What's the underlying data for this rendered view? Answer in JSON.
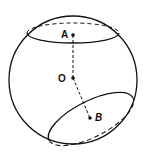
{
  "diagram": {
    "points": [
      {
        "id": "A",
        "label": "A"
      },
      {
        "id": "O",
        "label": "O"
      },
      {
        "id": "B",
        "label": "B"
      }
    ],
    "colors": {
      "stroke": "#111111",
      "background": "#ffffff"
    }
  }
}
